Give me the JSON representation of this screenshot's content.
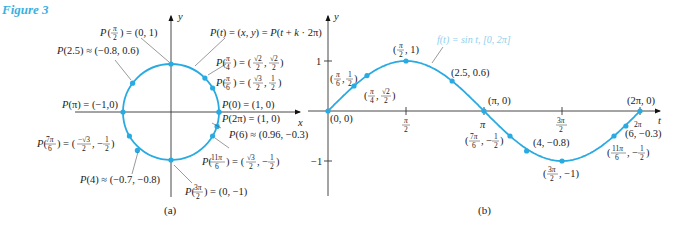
{
  "figure": {
    "title": "Figure 3",
    "caption_a": "(a)",
    "caption_b": "(b)",
    "accent_color": "#29abe2",
    "title_color": "#3bb0e0"
  },
  "panel_a": {
    "axis_x_label": "x",
    "axis_y_label": "y",
    "labels": [
      {
        "id": "p_pi_over_2",
        "text": "P(π/2) = (0, 1)"
      },
      {
        "id": "p_general",
        "text": "P(t) = (x, y) = P(t + k·2π)"
      },
      {
        "id": "p_2_5",
        "text": "P(2.5) ≈ (−0.8, 0.6)"
      },
      {
        "id": "p_pi_over_4",
        "text": "P(π/4) = (√2/2, √2/2)"
      },
      {
        "id": "p_pi_over_6",
        "text": "P(π/6) = (√3/2, 1/2)"
      },
      {
        "id": "p_pi",
        "text": "P(π) = (−1,0)"
      },
      {
        "id": "p_0",
        "text": "P(0) = (1, 0)"
      },
      {
        "id": "p_2pi",
        "text": "P(2π) = (1, 0)"
      },
      {
        "id": "p_6",
        "text": "P(6) ≈ (0.96, −0.3)"
      },
      {
        "id": "p_7pi_over_6",
        "text": "P(7π/6) = (−√3/2, −1/2)"
      },
      {
        "id": "p_11pi_over_6",
        "text": "P(11π/6) = (√3/2, −1/2)"
      },
      {
        "id": "p_4",
        "text": "P(4) ≈ (−0.7, −0.8)"
      },
      {
        "id": "p_3pi_over_2",
        "text": "P(3π/2) = (0, −1)"
      }
    ],
    "points_t": [
      0,
      0.5236,
      0.7854,
      1.5708,
      2.5,
      3.1416,
      3.6652,
      4,
      4.7124,
      5.7596,
      6
    ]
  },
  "panel_b": {
    "axis_x_label": "t",
    "axis_y_label": "y",
    "legend": "f(t) = sin t, [0, 2π]",
    "x_ticks": [
      "π/2",
      "π",
      "3π/2",
      "2π"
    ],
    "y_ticks": [
      "1",
      "−1"
    ],
    "point_labels": [
      {
        "id": "b_0",
        "text": "(0, 0)"
      },
      {
        "id": "b_pi6",
        "text": "(π/6, 1/2)"
      },
      {
        "id": "b_pi4",
        "text": "(π/4, √2/2)"
      },
      {
        "id": "b_pi2",
        "text": "(π/2, 1)"
      },
      {
        "id": "b_2_5",
        "text": "(2.5, 0.6)"
      },
      {
        "id": "b_pi",
        "text": "(π, 0)"
      },
      {
        "id": "b_7pi6",
        "text": "(7π/6, −1/2)"
      },
      {
        "id": "b_4",
        "text": "(4, −0.8)"
      },
      {
        "id": "b_3pi2",
        "text": "(3π/2, −1)"
      },
      {
        "id": "b_11pi6",
        "text": "(11π/6, −1/2)"
      },
      {
        "id": "b_6",
        "text": "(6, −0.3)"
      },
      {
        "id": "b_2pi",
        "text": "(2π, 0)"
      }
    ]
  },
  "chart_data": {
    "type": "line",
    "title": "f(t) = sin t, [0, 2π]",
    "xlabel": "t",
    "ylabel": "y",
    "xlim": [
      0,
      6.2832
    ],
    "ylim": [
      -1,
      1
    ],
    "x_tick_labels": [
      "π/2",
      "π",
      "3π/2",
      "2π"
    ],
    "y_tick_labels": [
      "1",
      "−1"
    ],
    "series": [
      {
        "name": "sin t",
        "x": [
          0,
          0.5236,
          0.7854,
          1.5708,
          2.5,
          3.1416,
          3.6652,
          4,
          4.7124,
          5.7596,
          6,
          6.2832
        ],
        "y": [
          0,
          0.5,
          0.7071,
          1,
          0.6,
          0,
          -0.5,
          -0.8,
          -1,
          -0.5,
          -0.3,
          0
        ]
      }
    ],
    "unit_circle_points": [
      {
        "t": "0",
        "x": 1,
        "y": 0
      },
      {
        "t": "π/6",
        "x": 0.866,
        "y": 0.5
      },
      {
        "t": "π/4",
        "x": 0.7071,
        "y": 0.7071
      },
      {
        "t": "π/2",
        "x": 0,
        "y": 1
      },
      {
        "t": "2.5",
        "x": -0.8,
        "y": 0.6
      },
      {
        "t": "π",
        "x": -1,
        "y": 0
      },
      {
        "t": "7π/6",
        "x": -0.866,
        "y": -0.5
      },
      {
        "t": "4",
        "x": -0.7,
        "y": -0.8
      },
      {
        "t": "3π/2",
        "x": 0,
        "y": -1
      },
      {
        "t": "11π/6",
        "x": 0.866,
        "y": -0.5
      },
      {
        "t": "6",
        "x": 0.96,
        "y": -0.3
      },
      {
        "t": "2π",
        "x": 1,
        "y": 0
      }
    ]
  }
}
